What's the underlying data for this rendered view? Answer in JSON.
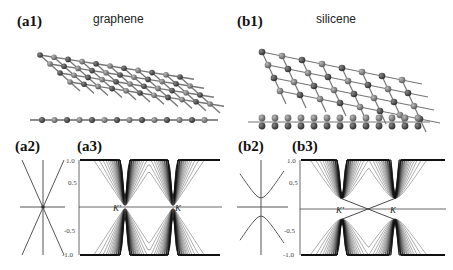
{
  "figure": {
    "panels": {
      "a1": {
        "label": "(a1)",
        "title": "graphene"
      },
      "b1": {
        "label": "(b1)",
        "title": "silicene"
      },
      "a2": {
        "label": "(a2)"
      },
      "a3": {
        "label": "(a3)"
      },
      "b2": {
        "label": "(b2)"
      },
      "b3": {
        "label": "(b3)"
      }
    },
    "ticks": {
      "top": "1.0",
      "mid_top": "0.5",
      "mid_bottom": "-0.5",
      "bottom": "-1.0"
    },
    "k_points": {
      "k_prime": "K'",
      "k": "K"
    }
  },
  "chart_data": [
    {
      "type": "line",
      "panel": "(a2)",
      "title": "graphene Dirac cone (linear dispersion)",
      "series": [
        {
          "name": "upper band",
          "shape": "V linear, gapless"
        },
        {
          "name": "lower band",
          "shape": "inverted V linear, gapless"
        }
      ],
      "gap": 0
    },
    {
      "type": "line",
      "panel": "(a3)",
      "title": "graphene nanoribbon band structure",
      "ylabel": "E",
      "ylim": [
        -1.0,
        1.0
      ],
      "yticks": [
        1.0,
        0.5,
        -0.5,
        -1.0
      ],
      "annotations": [
        "K'",
        "K"
      ],
      "notes": "dense subbands forming cones touching zero energy at K' and K"
    },
    {
      "type": "line",
      "panel": "(b2)",
      "title": "silicene gapped Dirac cone",
      "series": [
        {
          "name": "upper band",
          "shape": "hyperbolic, minimum ~0.2"
        },
        {
          "name": "lower band",
          "shape": "hyperbolic, maximum ~-0.2"
        }
      ],
      "gap": 0.4
    },
    {
      "type": "line",
      "panel": "(b3)",
      "title": "silicene nanoribbon band structure",
      "ylim": [
        -1.0,
        1.0
      ],
      "yticks": [
        1.0,
        0.5,
        -0.5,
        -1.0
      ],
      "annotations": [
        "K'",
        "K"
      ],
      "notes": "gapped bulk subbands (~±0.2) at K' and K with crossing edge states at midpoint between K' and K"
    }
  ]
}
